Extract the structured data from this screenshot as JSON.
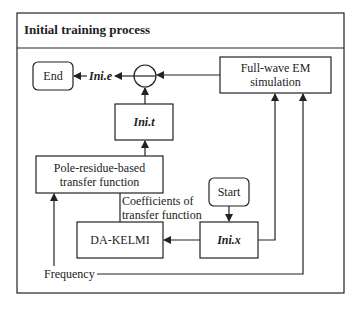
{
  "title": "Initial training process",
  "nodes": {
    "end": "End",
    "subtract": "−",
    "ini_t": "Ini.t",
    "fullwave_line1": "Full-wave EM",
    "fullwave_line2": "simulation",
    "pole_line1": "Pole-residue-based",
    "pole_line2": "transfer function",
    "start": "Start",
    "ini_x": "Ini.x",
    "dakelmi": "DA-KELMI"
  },
  "labels": {
    "ini_e": "Ini.e",
    "coeff_line1": "Coefficients of",
    "coeff_line2": "transfer function",
    "frequency": "Frequency"
  },
  "colors": {
    "stroke": "#222222",
    "background": "#ffffff"
  }
}
